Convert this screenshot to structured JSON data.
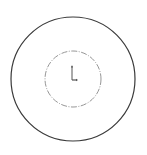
{
  "diagram": {
    "type": "cad-sketch",
    "background": "#ffffff",
    "outer_circle": {
      "cx": 73,
      "cy": 79,
      "r": 62,
      "stroke": "#3a3a3a",
      "stroke_width": 1.2,
      "style": "solid"
    },
    "inner_circle": {
      "cx": 73,
      "cy": 79,
      "r": 28,
      "stroke": "#8a8a8a",
      "stroke_width": 0.9,
      "style": "dashed"
    },
    "origin_marker": {
      "x": 72,
      "y": 80,
      "vertical_length": 14,
      "horizontal_length": 5,
      "color": "#555555"
    }
  }
}
